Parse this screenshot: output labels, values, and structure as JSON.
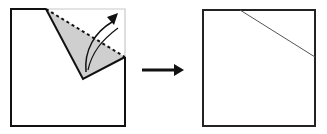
{
  "diagram": {
    "type": "origami-fold-step",
    "steps": [
      {
        "name": "before",
        "description": "Top-right corner folded down along dotted valley line"
      },
      {
        "name": "after",
        "description": "Unfolded square showing diagonal crease line"
      }
    ],
    "colors": {
      "outline": "#111111",
      "fold_fill": "#cfcfcf",
      "ghost_outline": "#c8c8c8",
      "crease": "#555555"
    },
    "arrow": {
      "direction": "right"
    }
  }
}
